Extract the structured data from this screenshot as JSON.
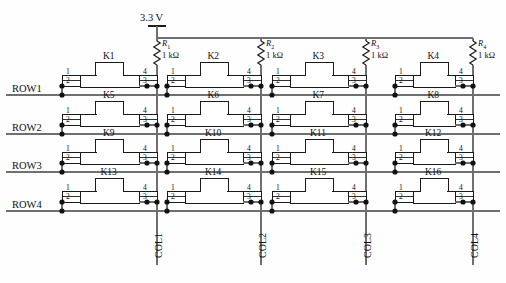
{
  "diagram": {
    "supply": {
      "label": "3.3 V",
      "x": 157,
      "y": 18
    },
    "rail_y": 38,
    "colors": {
      "wire": "#6f6f6f",
      "part": "#1a1a1a",
      "node": "#111111",
      "text": "#111111"
    },
    "resistors": [
      {
        "name": "R",
        "sub": "1",
        "value": "1 kΩ",
        "x": 157
      },
      {
        "name": "R",
        "sub": "2",
        "value": "1 kΩ",
        "x": 261
      },
      {
        "name": "R",
        "sub": "3",
        "value": "1 kΩ",
        "x": 366
      },
      {
        "name": "R",
        "sub": "4",
        "value": "1 kΩ",
        "x": 473
      }
    ],
    "rows": [
      {
        "label": "ROW1",
        "y": 95
      },
      {
        "label": "ROW2",
        "y": 134
      },
      {
        "label": "ROW3",
        "y": 172
      },
      {
        "label": "ROW4",
        "y": 211
      }
    ],
    "cols": [
      {
        "label": "COL1",
        "x": 157
      },
      {
        "label": "COL2",
        "x": 261
      },
      {
        "label": "COL3",
        "x": 366
      },
      {
        "label": "COL4",
        "x": 473
      }
    ],
    "pin_numbers": {
      "top_left": "1",
      "bottom_left": "2",
      "top_right": "4",
      "bottom_right": "3"
    },
    "switches": [
      {
        "label": "K1",
        "col": 0,
        "row": 0
      },
      {
        "label": "K2",
        "col": 1,
        "row": 0
      },
      {
        "label": "K3",
        "col": 2,
        "row": 0
      },
      {
        "label": "K4",
        "col": 3,
        "row": 0
      },
      {
        "label": "K5",
        "col": 0,
        "row": 1
      },
      {
        "label": "K6",
        "col": 1,
        "row": 1
      },
      {
        "label": "K7",
        "col": 2,
        "row": 1
      },
      {
        "label": "K8",
        "col": 3,
        "row": 1
      },
      {
        "label": "K9",
        "col": 0,
        "row": 2
      },
      {
        "label": "K10",
        "col": 1,
        "row": 2
      },
      {
        "label": "K11",
        "col": 2,
        "row": 2
      },
      {
        "label": "K12",
        "col": 3,
        "row": 2
      },
      {
        "label": "K13",
        "col": 0,
        "row": 3
      },
      {
        "label": "K14",
        "col": 1,
        "row": 3
      },
      {
        "label": "K15",
        "col": 2,
        "row": 3
      },
      {
        "label": "K16",
        "col": 3,
        "row": 3
      }
    ]
  }
}
